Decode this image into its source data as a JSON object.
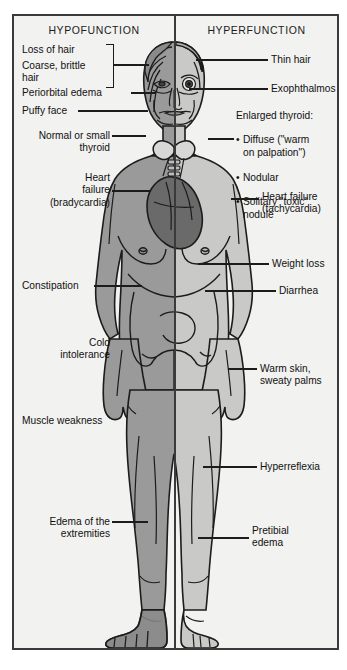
{
  "figure": {
    "columns": {
      "left_header": "HYPOFUNCTION",
      "right_header": "HYPERFUNCTION"
    },
    "colors": {
      "frame": "#3a3a3a",
      "panel_background": "#f2f2f0",
      "body_hypofunction_fill": "#9a9a9a",
      "body_hyperfunction_fill": "#c9c9c7",
      "heart_fill": "#6a6a6a",
      "outline": "#1c1c1c",
      "text": "#111111"
    }
  },
  "hypofunction_labels": {
    "hair_group": {
      "line1": "Loss of hair",
      "line2": "Coarse, brittle",
      "line3": "hair"
    },
    "periorbital_edema": "Periorbital edema",
    "puffy_face": "Puffy face",
    "thyroid": "Normal or small\nthyroid",
    "heart_failure": "Heart\nfailure\n(bradycardia)",
    "constipation": "Constipation",
    "cold_intolerance": "Cold\nintolerance",
    "muscle_weakness": "Muscle weakness",
    "edema_extremities": "Edema of the\nextremities"
  },
  "hyperfunction_labels": {
    "thin_hair": "Thin hair",
    "exophthalmos": "Exophthalmos",
    "enlarged_thyroid_title": "Enlarged thyroid:",
    "enlarged_thyroid_items": [
      "Diffuse (\"warm\non palpation\")",
      "Nodular",
      "Solitary \"toxic\"\nnodule"
    ],
    "heart_failure": "Heart failure\n(tachycardia)",
    "weight_loss": "Weight loss",
    "diarrhea": "Diarrhea",
    "warm_skin": "Warm skin,\nsweaty palms",
    "hyperreflexia": "Hyperreflexia",
    "pretibial_edema": "Pretibial\nedema"
  }
}
